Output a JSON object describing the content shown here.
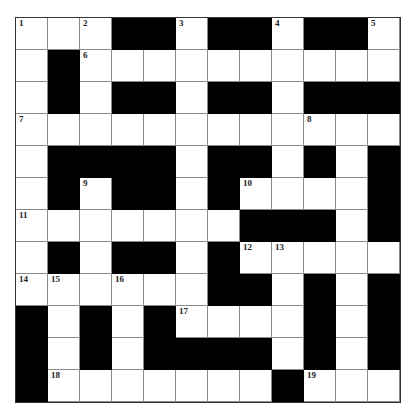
{
  "puzzle": {
    "rows": 12,
    "cols": 12,
    "colors": {
      "block": "#000000",
      "cell": "#ffffff",
      "line": "#8a8a8a"
    },
    "grid": [
      "...##.##.##.",
      ".#.........",
      ".#.##.##.###",
      "............",
      ".####.##.#.#",
      ".#.##.#....#",
      ".......###.#",
      ".#.##.#.....",
      "......##.#.#",
      "#.#.#....#.#",
      "#.#.####.#.#",
      "#.......#..."
    ],
    "numbers": [
      {
        "r": 0,
        "c": 0,
        "n": "1"
      },
      {
        "r": 0,
        "c": 2,
        "n": "2"
      },
      {
        "r": 0,
        "c": 5,
        "n": "3"
      },
      {
        "r": 0,
        "c": 8,
        "n": "4"
      },
      {
        "r": 0,
        "c": 11,
        "n": "5"
      },
      {
        "r": 1,
        "c": 2,
        "n": "6"
      },
      {
        "r": 3,
        "c": 0,
        "n": "7"
      },
      {
        "r": 3,
        "c": 9,
        "n": "8"
      },
      {
        "r": 5,
        "c": 2,
        "n": "9"
      },
      {
        "r": 5,
        "c": 7,
        "n": "10"
      },
      {
        "r": 6,
        "c": 0,
        "n": "11"
      },
      {
        "r": 7,
        "c": 7,
        "n": "12"
      },
      {
        "r": 7,
        "c": 8,
        "n": "13"
      },
      {
        "r": 8,
        "c": 0,
        "n": "14"
      },
      {
        "r": 8,
        "c": 1,
        "n": "15"
      },
      {
        "r": 8,
        "c": 3,
        "n": "16"
      },
      {
        "r": 9,
        "c": 5,
        "n": "17"
      },
      {
        "r": 11,
        "c": 1,
        "n": "18"
      },
      {
        "r": 11,
        "c": 9,
        "n": "19"
      }
    ]
  }
}
